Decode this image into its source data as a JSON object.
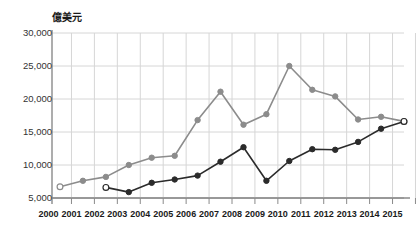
{
  "chart_data": {
    "type": "line",
    "title": "",
    "subtitle": "",
    "xlabel": "",
    "ylabel": "億美元",
    "ylim": [
      5000,
      30000
    ],
    "ytick_values": [
      30000,
      25000,
      20000,
      15000,
      10000,
      5000
    ],
    "ytick_labels": [
      "30,000",
      "25,000",
      "20,000",
      "15,000",
      "10,000",
      "5,000"
    ],
    "grid": true,
    "legend": "none",
    "x": [
      2000,
      2001,
      2002,
      2003,
      2004,
      2005,
      2006,
      2007,
      2008,
      2009,
      2010,
      2011,
      2012,
      2013,
      2014,
      2015
    ],
    "xtick_labels": [
      "2000",
      "2001",
      "2002",
      "2003",
      "2004",
      "2005",
      "2006",
      "2007",
      "2008",
      "2009",
      "2010",
      "2011",
      "2012",
      "2013",
      "2014",
      "2015"
    ],
    "series": [
      {
        "name": "gray-series",
        "color": "#8c8c8c",
        "marker": "circle",
        "open_markers_at": [
          2000,
          2015
        ],
        "x": [
          2000,
          2001,
          2002,
          2003,
          2004,
          2005,
          2006,
          2007,
          2008,
          2009,
          2010,
          2011,
          2012,
          2013,
          2014,
          2015
        ],
        "values": [
          6700,
          7600,
          8200,
          10000,
          11100,
          11400,
          16800,
          21100,
          16100,
          17700,
          25000,
          21400,
          20400,
          16900,
          17300,
          16600
        ]
      },
      {
        "name": "black-series",
        "color": "#2b2b2b",
        "marker": "circle",
        "open_markers_at": [
          2002,
          2015
        ],
        "x": [
          2002,
          2003,
          2004,
          2005,
          2006,
          2007,
          2008,
          2009,
          2010,
          2011,
          2012,
          2013,
          2014,
          2015
        ],
        "values": [
          6600,
          5900,
          7300,
          7800,
          8400,
          10500,
          12700,
          7600,
          10600,
          12400,
          12300,
          13500,
          15500,
          16600
        ]
      }
    ]
  },
  "axes": {
    "axis_color": "#8a8a8a",
    "grid_color": "#d6d6d6",
    "background": "#ffffff"
  }
}
